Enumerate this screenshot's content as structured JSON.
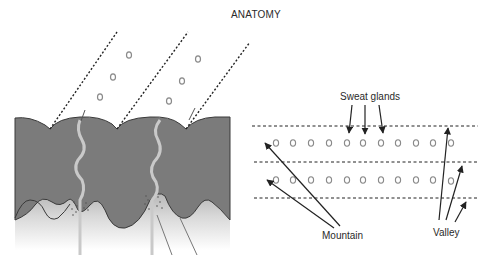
{
  "title": "ANATOMY",
  "left_panel": {
    "description": "Cross-section of skin: epidermis with ridges, sweat ducts, and papillae",
    "colors": {
      "epidermis": "#7a7a7a",
      "dermis_top": "#9a9a9a",
      "dermis_bottom": "#ffffff",
      "duct": "#c8c8c8",
      "pore_circles": "#8a8a8a",
      "dashed_lines": "#222222"
    },
    "pore_groups": 2,
    "ducts": 2
  },
  "right_panel": {
    "description": "Top view of ridges with sweat gland pores between dashed ridge lines",
    "labels": {
      "sweat_glands": "Sweat glands",
      "mountain": "Mountain",
      "valley": "Valley"
    },
    "dashed_lines": 3,
    "pore_rows": 2,
    "pores_per_row": 11
  }
}
